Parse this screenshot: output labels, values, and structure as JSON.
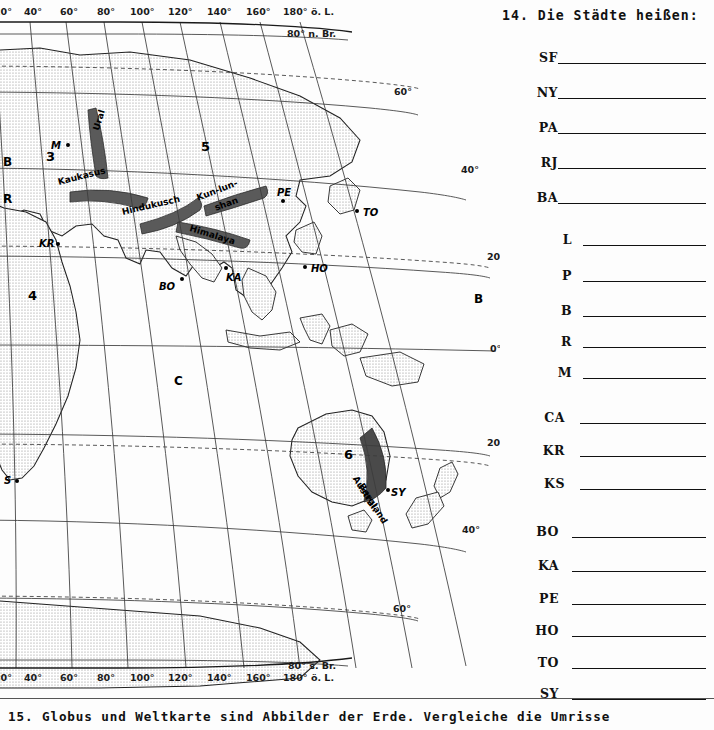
{
  "page": {
    "footer_note": "15. Globus und Weltkarte sind Abbilder der Erde. Vergleiche die Umrisse"
  },
  "map": {
    "title": "world-map-eastern-hemisphere",
    "longitude_labels": [
      {
        "text": "20°",
        "x": -6,
        "y": 6
      },
      {
        "text": "40°",
        "x": 24,
        "y": 6
      },
      {
        "text": "60°",
        "x": 60,
        "y": 6
      },
      {
        "text": "80°",
        "x": 97,
        "y": 6
      },
      {
        "text": "100°",
        "x": 130,
        "y": 6
      },
      {
        "text": "120°",
        "x": 168,
        "y": 6
      },
      {
        "text": "140°",
        "x": 207,
        "y": 6
      },
      {
        "text": "160°",
        "x": 246,
        "y": 6
      },
      {
        "text": "180° ö. L.",
        "x": 283,
        "y": 6
      }
    ],
    "longitude_labels_bottom": [
      {
        "text": "20°",
        "x": -6,
        "y": 672
      },
      {
        "text": "40°",
        "x": 24,
        "y": 672
      },
      {
        "text": "60°",
        "x": 60,
        "y": 672
      },
      {
        "text": "80°",
        "x": 97,
        "y": 672
      },
      {
        "text": "100°",
        "x": 130,
        "y": 672
      },
      {
        "text": "120°",
        "x": 168,
        "y": 672
      },
      {
        "text": "140°",
        "x": 207,
        "y": 672
      },
      {
        "text": "160°",
        "x": 246,
        "y": 672
      },
      {
        "text": "180° ö. L.",
        "x": 283,
        "y": 672
      }
    ],
    "latitude_labels": [
      {
        "text": "80° n. Br.",
        "x": 287,
        "y": 28
      },
      {
        "text": "60°",
        "x": 394,
        "y": 86
      },
      {
        "text": "40°",
        "x": 461,
        "y": 164
      },
      {
        "text": "20°",
        "x": 487,
        "y": 251
      },
      {
        "text": "0°",
        "x": 490,
        "y": 343
      },
      {
        "text": "20°",
        "x": 487,
        "y": 437
      },
      {
        "text": "40°",
        "x": 462,
        "y": 524
      },
      {
        "text": "60°",
        "x": 393,
        "y": 603
      },
      {
        "text": "80° s. Br.",
        "x": 288,
        "y": 660
      }
    ],
    "region_numbers": [
      {
        "text": "3",
        "x": 46,
        "y": 149
      },
      {
        "text": "5",
        "x": 201,
        "y": 139
      },
      {
        "text": "4",
        "x": 28,
        "y": 288
      },
      {
        "text": "6",
        "x": 344,
        "y": 447
      }
    ],
    "ocean_letters": [
      {
        "text": "B",
        "x": 3,
        "y": 155
      },
      {
        "text": "R",
        "x": 3,
        "y": 192
      },
      {
        "text": "B",
        "x": 474,
        "y": 292
      },
      {
        "text": "C",
        "x": 174,
        "y": 374
      }
    ],
    "mountain_ranges": [
      {
        "text": "Ural",
        "x": 96,
        "y": 125,
        "rotate": -73
      },
      {
        "text": "Kaukasus",
        "x": 58,
        "y": 177,
        "rotate": -14
      },
      {
        "text": "Hindukusch",
        "x": 122,
        "y": 207,
        "rotate": -13
      },
      {
        "text": "Kun-lun-",
        "x": 197,
        "y": 193,
        "rotate": -21
      },
      {
        "text": "shan",
        "x": 215,
        "y": 203,
        "rotate": -20
      },
      {
        "text": "Himalaya",
        "x": 190,
        "y": 223,
        "rotate": 17
      },
      {
        "text": "Austral.",
        "x": 355,
        "y": 472,
        "rotate": 58
      },
      {
        "text": "Bergland",
        "x": 361,
        "y": 479,
        "rotate": 58
      }
    ],
    "city_markers": [
      {
        "code": "M",
        "label_x": 51,
        "label_y": 140,
        "dot_x": 66,
        "dot_y": 143,
        "italic": true
      },
      {
        "code": "KR",
        "label_x": 39,
        "label_y": 238,
        "dot_x": 56,
        "dot_y": 242,
        "italic": true
      },
      {
        "code": "BO",
        "label_x": 159,
        "label_y": 281,
        "dot_x": 180,
        "dot_y": 277,
        "italic": true
      },
      {
        "code": "KA",
        "label_x": 226,
        "label_y": 272,
        "dot_x": 224,
        "dot_y": 266,
        "italic": true
      },
      {
        "code": "PE",
        "label_x": 277,
        "label_y": 187,
        "dot_x": 281,
        "dot_y": 199,
        "italic": true
      },
      {
        "code": "TO",
        "label_x": 363,
        "label_y": 207,
        "dot_x": 355,
        "dot_y": 209,
        "italic": true
      },
      {
        "code": "HO",
        "label_x": 311,
        "label_y": 263,
        "dot_x": 303,
        "dot_y": 265,
        "italic": true
      },
      {
        "code": "SY",
        "label_x": 391,
        "label_y": 487,
        "dot_x": 386,
        "dot_y": 488,
        "italic": true
      },
      {
        "code": "S",
        "label_x": 4,
        "label_y": 475,
        "dot_x": 15,
        "dot_y": 479,
        "italic": true
      }
    ]
  },
  "task14": {
    "heading": "14. Die Städte heißen:",
    "answers": [
      {
        "code": "SF",
        "y": 50,
        "label_left": 12,
        "line_left": 58,
        "line_width": 148
      },
      {
        "code": "NY",
        "y": 85,
        "label_left": 12,
        "line_left": 58,
        "line_width": 148
      },
      {
        "code": "PA",
        "y": 120,
        "label_left": 12,
        "line_left": 58,
        "line_width": 148
      },
      {
        "code": "RJ",
        "y": 155,
        "label_left": 12,
        "line_left": 58,
        "line_width": 148
      },
      {
        "code": "BA",
        "y": 190,
        "label_left": 12,
        "line_left": 58,
        "line_width": 148
      },
      {
        "code": "L",
        "y": 232,
        "label_left": 26,
        "line_left": 83,
        "line_width": 123
      },
      {
        "code": "P",
        "y": 268,
        "label_left": 26,
        "line_left": 83,
        "line_width": 123
      },
      {
        "code": "B",
        "y": 303,
        "label_left": 26,
        "line_left": 83,
        "line_width": 123
      },
      {
        "code": "R",
        "y": 334,
        "label_left": 26,
        "line_left": 83,
        "line_width": 123
      },
      {
        "code": "M",
        "y": 365,
        "label_left": 26,
        "line_left": 83,
        "line_width": 123
      },
      {
        "code": "CA",
        "y": 410,
        "label_left": 19,
        "line_left": 80,
        "line_width": 126
      },
      {
        "code": "KR",
        "y": 443,
        "label_left": 19,
        "line_left": 80,
        "line_width": 126
      },
      {
        "code": "KS",
        "y": 476,
        "label_left": 19,
        "line_left": 80,
        "line_width": 126
      },
      {
        "code": "BO",
        "y": 524,
        "label_left": 13,
        "line_left": 72,
        "line_width": 134
      },
      {
        "code": "KA",
        "y": 558,
        "label_left": 13,
        "line_left": 72,
        "line_width": 134
      },
      {
        "code": "PE",
        "y": 591,
        "label_left": 13,
        "line_left": 72,
        "line_width": 134
      },
      {
        "code": "HO",
        "y": 623,
        "label_left": 13,
        "line_left": 72,
        "line_width": 134
      },
      {
        "code": "TO",
        "y": 655,
        "label_left": 13,
        "line_left": 72,
        "line_width": 134
      },
      {
        "code": "SY",
        "y": 686,
        "label_left": 13,
        "line_left": 72,
        "line_width": 134
      }
    ]
  },
  "colors": {
    "land_fill": "#e3e3e3",
    "ink": "#111111",
    "grid": "#3b3b3b",
    "mountain": "#4a4a4a"
  }
}
